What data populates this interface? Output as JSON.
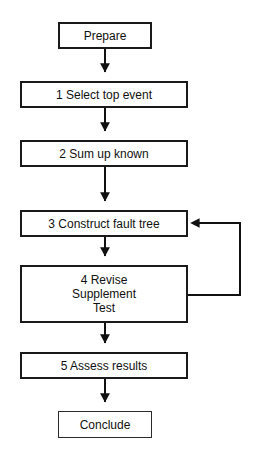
{
  "diagram": {
    "type": "flowchart",
    "background_color": "#ffffff",
    "line_color": "#111111",
    "text_color": "#111111",
    "nodes": [
      {
        "id": "prepare",
        "label": "Prepare",
        "shape": "rectangle",
        "x": 58,
        "y": 22,
        "w": 94,
        "h": 27
      },
      {
        "id": "step1",
        "label": "1 Select top event",
        "shape": "rectangle",
        "x": 20,
        "y": 81,
        "w": 168,
        "h": 27
      },
      {
        "id": "step2",
        "label": "2 Sum up known",
        "shape": "rectangle",
        "x": 20,
        "y": 140,
        "w": 168,
        "h": 27
      },
      {
        "id": "step3",
        "label": "3 Construct fault tree",
        "shape": "rectangle",
        "x": 20,
        "y": 210,
        "w": 168,
        "h": 27
      },
      {
        "id": "step4",
        "label": "4  Revise\nSupplement\nTest",
        "shape": "rectangle",
        "x": 20,
        "y": 265,
        "w": 168,
        "h": 58
      },
      {
        "id": "step5",
        "label": "5 Assess results",
        "shape": "rectangle",
        "x": 20,
        "y": 352,
        "w": 168,
        "h": 27
      },
      {
        "id": "conclude",
        "label": "Conclude",
        "shape": "rectangle",
        "x": 58,
        "y": 411,
        "w": 94,
        "h": 27
      }
    ],
    "edges": [
      {
        "id": "prepare-to-step1",
        "from": "prepare",
        "to": "step1",
        "kind": "straight-down",
        "arrow": "down"
      },
      {
        "id": "step1-to-step2",
        "from": "step1",
        "to": "step2",
        "kind": "straight-down",
        "arrow": "down"
      },
      {
        "id": "step2-to-step3",
        "from": "step2",
        "to": "step3",
        "kind": "straight-down",
        "arrow": "down"
      },
      {
        "id": "step3-to-step4",
        "from": "step3",
        "to": "step4",
        "kind": "straight-down",
        "arrow": "down"
      },
      {
        "id": "step4-to-step5",
        "from": "step4",
        "to": "step5",
        "kind": "straight-down",
        "arrow": "down"
      },
      {
        "id": "step5-to-conclude",
        "from": "step5",
        "to": "conclude",
        "kind": "straight-down",
        "arrow": "down"
      },
      {
        "id": "step4-feedback-to-step3",
        "from": "step4",
        "to": "step3",
        "kind": "loop-right",
        "arrow": "left"
      }
    ]
  }
}
